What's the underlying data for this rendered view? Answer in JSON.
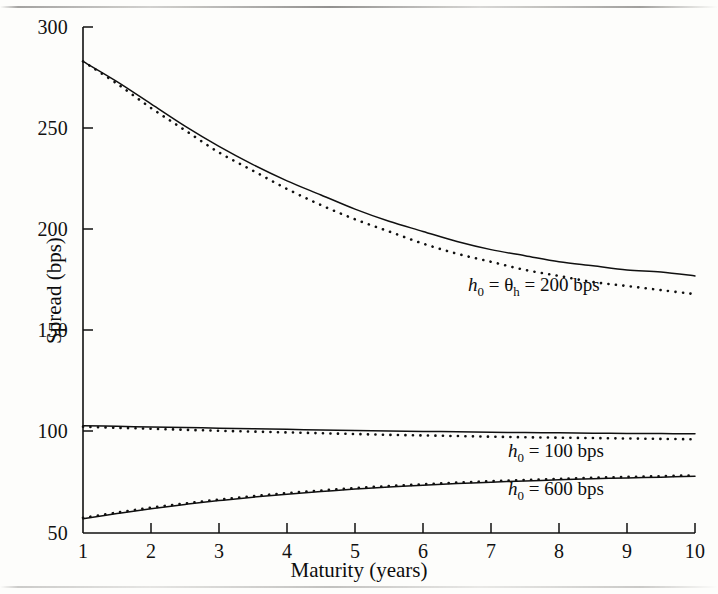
{
  "figure": {
    "background_color": "#fdfdfb",
    "ink_color": "#101010"
  },
  "chart_data": {
    "type": "line",
    "title": "",
    "xlabel": "Maturity (years)",
    "ylabel": "Spread (bps)",
    "xlim": [
      1,
      10
    ],
    "ylim": [
      50,
      300
    ],
    "xticks": [
      1,
      2,
      3,
      4,
      5,
      6,
      7,
      8,
      9,
      10
    ],
    "xticklabels": [
      "1",
      "2",
      "3",
      "4",
      "5",
      "6",
      "7",
      "8",
      "9",
      "10"
    ],
    "yticks": [
      50,
      100,
      150,
      200,
      250,
      300
    ],
    "yticklabels": [
      "50",
      "100",
      "150",
      "200",
      "250",
      "300"
    ],
    "grid": false,
    "legend_position": "inline-annotations",
    "x": [
      1,
      1.5,
      2,
      2.5,
      3,
      3.5,
      4,
      4.5,
      5,
      5.5,
      6,
      6.5,
      7,
      7.5,
      8,
      8.5,
      9,
      9.5,
      10
    ],
    "series": [
      {
        "name": "h0 = theta_h = 200 bps (solid)",
        "style": "solid",
        "annotation": "h0 = θh = 200 bps",
        "values": [
          283,
          273,
          262,
          251,
          241,
          232,
          224,
          217,
          210,
          204,
          199,
          194,
          190,
          187,
          184,
          182,
          180,
          179,
          177
        ]
      },
      {
        "name": "h0 = theta_h = 200 bps (dotted)",
        "style": "dotted",
        "annotation": "h0 = θh = 200 bps",
        "values": [
          283,
          272,
          260,
          249,
          238,
          229,
          220,
          212,
          205,
          199,
          193,
          188,
          184,
          180,
          177,
          174,
          172,
          170,
          168
        ]
      },
      {
        "name": "h0 = 100 bps (solid)",
        "style": "solid",
        "annotation": "h0 = 100 bps",
        "values": [
          103,
          102.7,
          102.4,
          102.1,
          101.8,
          101.5,
          101.2,
          100.9,
          100.6,
          100.4,
          100.2,
          100.0,
          99.8,
          99.6,
          99.5,
          99.3,
          99.2,
          99.1,
          99.0
        ]
      },
      {
        "name": "h0 = 100 bps (dotted)",
        "style": "dotted",
        "annotation": "h0 = 100 bps",
        "values": [
          102.5,
          102.0,
          101.5,
          101.0,
          100.5,
          100.1,
          99.7,
          99.3,
          98.9,
          98.5,
          98.2,
          97.9,
          97.6,
          97.3,
          97.1,
          96.9,
          96.7,
          96.5,
          96.3
        ]
      },
      {
        "name": "h0 = 600 bps (solid)",
        "style": "solid",
        "annotation": "h0 = 600 bps",
        "values": [
          57,
          59.6,
          62,
          64.1,
          66,
          67.7,
          69.2,
          70.5,
          71.7,
          72.7,
          73.6,
          74.4,
          75.1,
          75.7,
          76.3,
          76.8,
          77.2,
          77.6,
          78
        ]
      },
      {
        "name": "h0 = 600 bps (dotted)",
        "style": "dotted",
        "annotation": "h0 = 600 bps",
        "values": [
          57.5,
          60.1,
          62.5,
          64.6,
          66.5,
          68.2,
          69.7,
          71.0,
          72.2,
          73.2,
          74.1,
          74.9,
          75.6,
          76.2,
          76.8,
          77.3,
          77.7,
          78.1,
          78.5
        ]
      }
    ],
    "annotations": [
      {
        "text_html": "h<sub>0</sub> = θ<sub>h</sub> = 200 bps",
        "h0": "h",
        "sub0": "0",
        "theta": "θ",
        "subh": "h",
        "value": "= 200 bps"
      },
      {
        "text_html": "h<sub>0</sub> = 100 bps",
        "value": "= 100 bps"
      },
      {
        "text_html": "h<sub>0</sub> = 600 bps",
        "value": "= 600 bps"
      }
    ]
  },
  "annotations_flat": [
    {
      "var": "h",
      "sub": "0",
      "mid": "=",
      "theta": "θ",
      "theta_sub": "h",
      "tail": "= 200 bps"
    },
    {
      "var": "h",
      "sub": "0",
      "tail": "= 100 bps"
    },
    {
      "var": "h",
      "sub": "0",
      "tail": "= 600 bps"
    }
  ]
}
